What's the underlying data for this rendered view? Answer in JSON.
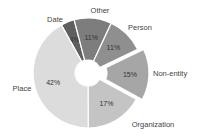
{
  "chart_data": {
    "type": "pie",
    "subtype": "doughnut",
    "title": "",
    "categories": [
      "Date",
      "Other",
      "Person",
      "Non-entity",
      "Organization",
      "Place"
    ],
    "values": [
      4,
      11,
      11,
      15,
      17,
      42
    ],
    "value_labels": [
      "4%",
      "11%",
      "11%",
      "15%",
      "17%",
      "42%"
    ],
    "value_notes": {
      "Date": "Label not clearly legible at source resolution; 4% inferred so that the six values sum to 100%."
    },
    "colors": [
      "#5f5f5f",
      "#7d7d7d",
      "#8f8f8f",
      "#a6a6a6",
      "#c4c4c4",
      "#dcdcdc"
    ],
    "exploded": [
      "Non-entity"
    ],
    "unit": "%",
    "legend": "none (category labels placed beside slices)"
  }
}
